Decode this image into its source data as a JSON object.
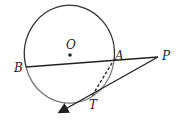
{
  "diagram": {
    "labels": {
      "O": "O",
      "A": "A",
      "B": "B",
      "P": "P",
      "T": "T"
    },
    "colors": {
      "stroke": "#222222",
      "circle": "#333333",
      "arc_lower": "#666666"
    }
  }
}
